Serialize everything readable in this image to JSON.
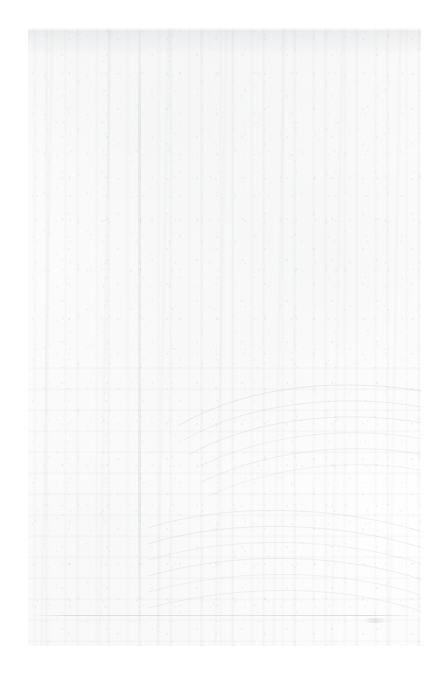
{
  "page": {
    "width": 446,
    "height": 678,
    "background_color": "#ffffff"
  },
  "photo": {
    "name": "faded-landscape-scan",
    "subject": "forest scene with vertical tree trunks and curved bands in the lower right",
    "content_area": {
      "left": 28,
      "top": 28,
      "width": 393,
      "height": 618
    },
    "condition": "near-blank; emulsion almost entirely faded to white",
    "dominant_color": "#ffffff",
    "ink_tone": "#969ca2",
    "visible_text": ""
  },
  "features": [
    {
      "name": "vertical-striations",
      "label": "Vertical striations resembling tree trunks",
      "region": "full height of content area"
    },
    {
      "name": "vertical-seam",
      "label": "Faint vertical seam running the full height",
      "region": "left-of-centre, approx x=138"
    },
    {
      "name": "concentric-arcs",
      "label": "Faint concentric curved arcs",
      "region": "right and lower-right quadrant"
    },
    {
      "name": "horizontal-ripples",
      "label": "Horizontal wavy bands",
      "region": "lower third of content area"
    },
    {
      "name": "baseline-rule",
      "label": "Thin horizontal rule near the bottom edge",
      "region": "approx y=616"
    },
    {
      "name": "stray-mark",
      "label": "Small stray mark in the lower-right margin",
      "region": "approx x=392, y=646"
    }
  ]
}
